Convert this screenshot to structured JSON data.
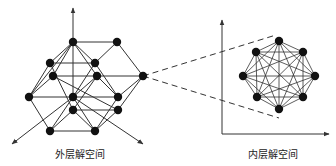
{
  "labels": {
    "outer": "外层解空间",
    "inner": "内层解空间"
  },
  "colors": {
    "line": "#333333",
    "node": "#111111",
    "background": "#ffffff"
  },
  "outer_space": {
    "nodes": [
      [
        73,
        42
      ],
      [
        117,
        42
      ],
      [
        50,
        63
      ],
      [
        95,
        63
      ],
      [
        53,
        76
      ],
      [
        97,
        76
      ],
      [
        143,
        76
      ],
      [
        29,
        97
      ],
      [
        73,
        97
      ],
      [
        118,
        97
      ],
      [
        73,
        110
      ],
      [
        118,
        110
      ],
      [
        50,
        131
      ],
      [
        95,
        131
      ]
    ],
    "edges": [
      [
        0,
        1
      ],
      [
        0,
        2
      ],
      [
        0,
        3
      ],
      [
        0,
        4
      ],
      [
        0,
        5
      ],
      [
        0,
        8
      ],
      [
        0,
        7
      ],
      [
        1,
        3
      ],
      [
        1,
        6
      ],
      [
        2,
        3
      ],
      [
        2,
        7
      ],
      [
        2,
        10
      ],
      [
        3,
        9
      ],
      [
        3,
        8
      ],
      [
        4,
        6
      ],
      [
        4,
        7
      ],
      [
        4,
        11
      ],
      [
        5,
        8
      ],
      [
        5,
        9
      ],
      [
        5,
        10
      ],
      [
        6,
        9
      ],
      [
        6,
        11
      ],
      [
        7,
        8
      ],
      [
        8,
        9
      ],
      [
        7,
        12
      ],
      [
        8,
        13
      ],
      [
        8,
        12
      ],
      [
        10,
        11
      ],
      [
        10,
        12
      ],
      [
        10,
        13
      ],
      [
        9,
        13
      ],
      [
        11,
        13
      ],
      [
        12,
        13
      ]
    ],
    "axes": [
      {
        "from": [
          73,
          42
        ],
        "to": [
          73,
          8
        ]
      },
      {
        "from": [
          73,
          97
        ],
        "to": [
          12,
          144
        ]
      },
      {
        "from": [
          73,
          97
        ],
        "to": [
          143,
          144
        ]
      }
    ]
  },
  "inner_space": {
    "nodes": [
      [
        279,
        41
      ],
      [
        303,
        52
      ],
      [
        315,
        76
      ],
      [
        303,
        97
      ],
      [
        279,
        109
      ],
      [
        257,
        97
      ],
      [
        243,
        76
      ],
      [
        256,
        52
      ]
    ],
    "axes": [
      {
        "from": [
          222,
          134
        ],
        "to": [
          222,
          20
        ]
      },
      {
        "from": [
          222,
          134
        ],
        "to": [
          329,
          134
        ]
      }
    ]
  },
  "connectors": [
    {
      "from": [
        143,
        76
      ],
      "to": [
        276,
        35
      ]
    },
    {
      "from": [
        143,
        76
      ],
      "to": [
        279,
        118
      ]
    }
  ]
}
